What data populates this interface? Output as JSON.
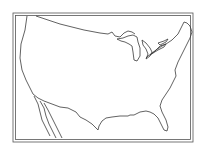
{
  "map": {
    "subject": "United States outline",
    "style": "black line art, blank outline map",
    "frame": "double-line border",
    "colors": {
      "line": "#3a3a3a",
      "background": "#ffffff"
    }
  }
}
